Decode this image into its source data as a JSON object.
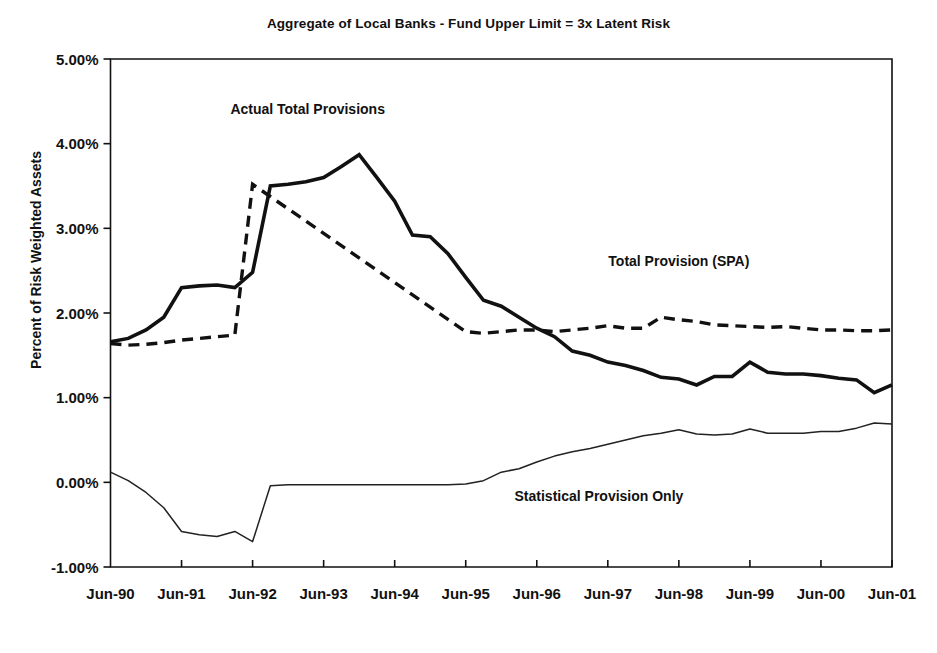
{
  "chart_data": {
    "type": "line",
    "title": "Aggregate of Local Banks - Fund Upper Limit = 3x Latent Risk",
    "xlabel": "",
    "ylabel": "Percent of Risk Weighted Assets",
    "ylim": [
      -1.0,
      5.0
    ],
    "ytick_labels": [
      "5.00%",
      "4.00%",
      "3.00%",
      "2.00%",
      "1.00%",
      "0.00%",
      "-1.00%"
    ],
    "ytick_values": [
      5.0,
      4.0,
      3.0,
      2.0,
      1.0,
      0.0,
      -1.0
    ],
    "xtick_labels": [
      "Jun-90",
      "Jun-91",
      "Jun-92",
      "Jun-93",
      "Jun-94",
      "Jun-95",
      "Jun-96",
      "Jun-97",
      "Jun-98",
      "Jun-99",
      "Jun-00",
      "Jun-01"
    ],
    "xtick_values": [
      0,
      4,
      8,
      12,
      16,
      20,
      24,
      28,
      32,
      36,
      40,
      44
    ],
    "x_unit": "quarter",
    "x_range": [
      0,
      44
    ],
    "grid": false,
    "legend": "annotations-inline",
    "annotations": [
      {
        "text": "Actual Total Provisions",
        "x": 11.1,
        "y": 4.35,
        "series": "actual_total_provisions"
      },
      {
        "text": "Total Provision (SPA)",
        "x": 32.0,
        "y": 2.55,
        "series": "total_provision_spa"
      },
      {
        "text": "Statistical Provision Only",
        "x": 27.5,
        "y": -0.22,
        "series": "statistical_provision_only"
      }
    ],
    "series": [
      {
        "name": "Actual Total Provisions",
        "style": "solid-thick",
        "color": "#111111",
        "x": [
          0,
          1,
          2,
          3,
          4,
          5,
          6,
          7,
          8,
          9,
          10,
          11,
          12,
          13,
          14,
          15,
          16,
          17,
          18,
          19,
          20,
          21,
          22,
          23,
          24,
          25,
          26,
          27,
          28,
          29,
          30,
          31,
          32,
          33,
          34,
          35,
          36,
          37,
          38,
          39,
          40,
          41,
          42,
          43,
          44
        ],
        "values": [
          1.66,
          1.7,
          1.8,
          1.95,
          2.3,
          2.32,
          2.33,
          2.3,
          2.48,
          3.5,
          3.52,
          3.55,
          3.6,
          3.73,
          3.87,
          3.6,
          3.32,
          2.92,
          2.9,
          2.7,
          2.42,
          2.15,
          2.08,
          1.95,
          1.82,
          1.72,
          1.55,
          1.5,
          1.42,
          1.38,
          1.32,
          1.24,
          1.22,
          1.15,
          1.25,
          1.25,
          1.42,
          1.3,
          1.28,
          1.28,
          1.26,
          1.23,
          1.21,
          1.06,
          1.15
        ]
      },
      {
        "name": "Total Provision (SPA)",
        "style": "dashed-thick",
        "color": "#111111",
        "x": [
          0,
          1,
          2,
          3,
          4,
          5,
          6,
          7,
          8,
          20,
          21,
          22,
          23,
          24,
          25,
          26,
          27,
          28,
          29,
          30,
          31,
          32,
          33,
          34,
          35,
          36,
          37,
          38,
          39,
          40,
          41,
          42,
          43,
          44
        ],
        "values": [
          1.64,
          1.62,
          1.63,
          1.65,
          1.68,
          1.7,
          1.72,
          1.74,
          3.52,
          1.78,
          1.76,
          1.78,
          1.8,
          1.8,
          1.78,
          1.8,
          1.82,
          1.85,
          1.82,
          1.82,
          1.95,
          1.92,
          1.9,
          1.86,
          1.85,
          1.84,
          1.83,
          1.84,
          1.82,
          1.8,
          1.8,
          1.79,
          1.79,
          1.8
        ],
        "note": "vertical jump from 1.74 to 3.52 at x=8 (Jun-92 quarter start); segment hidden between x=8 and x=20 where it coincides with the actual-provisions line"
      },
      {
        "name": "Statistical Provision Only",
        "style": "solid-thin",
        "color": "#222222",
        "x": [
          0,
          1,
          2,
          3,
          4,
          5,
          6,
          7,
          8,
          9,
          10,
          11,
          12,
          13,
          14,
          15,
          16,
          17,
          18,
          19,
          20,
          21,
          22,
          23,
          24,
          25,
          26,
          27,
          28,
          29,
          30,
          31,
          32,
          33,
          34,
          35,
          36,
          37,
          38,
          39,
          40,
          41,
          42,
          43,
          44
        ],
        "values": [
          0.12,
          0.02,
          -0.12,
          -0.3,
          -0.58,
          -0.62,
          -0.64,
          -0.58,
          -0.7,
          -0.04,
          -0.03,
          -0.03,
          -0.03,
          -0.03,
          -0.03,
          -0.03,
          -0.03,
          -0.03,
          -0.03,
          -0.03,
          -0.02,
          0.02,
          0.12,
          0.16,
          0.24,
          0.31,
          0.36,
          0.4,
          0.45,
          0.5,
          0.55,
          0.58,
          0.62,
          0.57,
          0.56,
          0.57,
          0.63,
          0.58,
          0.58,
          0.58,
          0.6,
          0.6,
          0.64,
          0.7,
          0.69
        ]
      }
    ]
  }
}
